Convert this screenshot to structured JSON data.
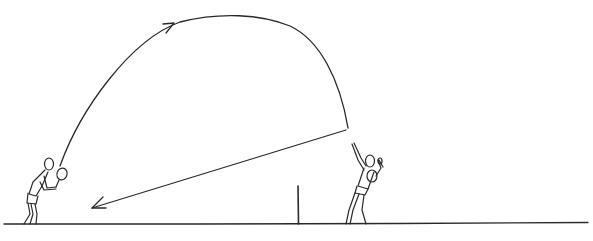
{
  "diagram": {
    "type": "sketch",
    "description_visible_text": "",
    "colors": {
      "ink": "#2a2a2a",
      "background": "#ffffff"
    },
    "elements": {
      "ground_line": {
        "x1": 4,
        "y1": 224,
        "x2": 588,
        "y2": 222
      },
      "net_post": {
        "x": 298,
        "y_top": 186,
        "y_bottom": 224
      },
      "lob_trajectory": {
        "start": [
          60,
          166
        ],
        "apex": [
          230,
          15
        ],
        "end": [
          348,
          128
        ],
        "arrow_at": [
          170,
          24
        ]
      },
      "return_arrow": {
        "from": [
          346,
          130
        ],
        "to": [
          92,
          208
        ]
      },
      "player_left": {
        "position": [
          40,
          195
        ],
        "pose": "serving-hold"
      },
      "player_right": {
        "position": [
          365,
          190
        ],
        "pose": "overhead-swing"
      }
    }
  }
}
